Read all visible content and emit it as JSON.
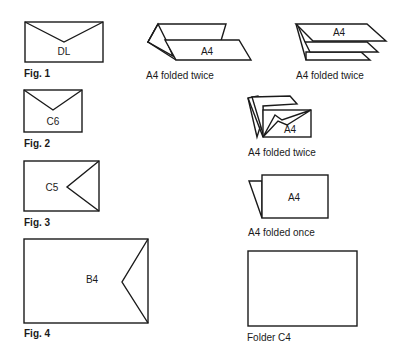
{
  "envelopes": [
    {
      "id": "dl",
      "size_label": "DL",
      "caption": "Fig. 1"
    },
    {
      "id": "c6",
      "size_label": "C6",
      "caption": "Fig. 2"
    },
    {
      "id": "c5",
      "size_label": "C5",
      "caption": "Fig. 3"
    },
    {
      "id": "b4",
      "size_label": "B4",
      "caption": "Fig. 4"
    }
  ],
  "folds": [
    {
      "id": "fold-twice-a",
      "paper_label": "A4",
      "caption": "A4 folded twice"
    },
    {
      "id": "fold-twice-b",
      "paper_label": "A4",
      "caption": "A4 folded twice"
    },
    {
      "id": "fold-twice-c",
      "paper_label": "A4",
      "caption": "A4 folded twice"
    },
    {
      "id": "fold-once",
      "paper_label": "A4",
      "caption": "A4 folded once"
    },
    {
      "id": "folder-c4",
      "paper_label": "",
      "caption": "Folder C4"
    }
  ],
  "colors": {
    "stroke": "#1a1a1a",
    "background": "#ffffff"
  }
}
